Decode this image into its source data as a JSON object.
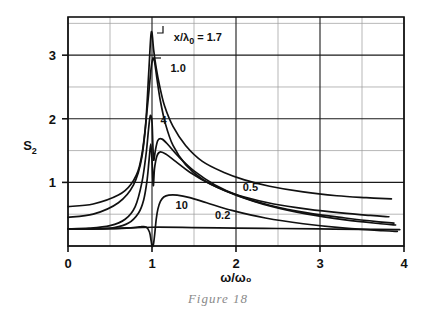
{
  "figure": {
    "caption": "Figure 18",
    "y_axis_label_main": "S",
    "y_axis_label_sub": "2",
    "x_axis_label_num": "ω",
    "x_axis_label_den": "ω",
    "x_axis_label_den_sub": "0",
    "x_axis_label_full": "ω/ω₀",
    "y_axis_label_full": "S₂",
    "param_label_prefix": "x/λ",
    "param_label_sub": "0",
    "param_label_eq": "= 1.7"
  },
  "chart_data": {
    "type": "line",
    "title": "Figure 18",
    "xlabel": "ω/ω₀",
    "ylabel": "S₂",
    "xlim": [
      0,
      4
    ],
    "ylim": [
      0,
      3.6
    ],
    "xticks": [
      0,
      1,
      2,
      3,
      4
    ],
    "xtick_labels": [
      "0",
      "1",
      "2",
      "3",
      "4"
    ],
    "yticks": [
      1,
      2,
      3
    ],
    "ytick_labels": [
      "1",
      "2",
      "3"
    ],
    "grid": true,
    "grid_spacing_x": 0.5,
    "grid_spacing_y": 0.5,
    "legend_position": "inline-curve-labels",
    "series_parameter_name": "x/λ₀",
    "series": [
      {
        "name": "1.7",
        "label": "x/λ₀ = 1.7",
        "label_x": 1.26,
        "label_y": 3.22,
        "peak_x": 1.0,
        "peak_y": 3.35,
        "x": [
          0.0,
          0.3,
          0.6,
          0.75,
          0.85,
          0.92,
          0.96,
          0.985,
          1.0,
          1.02,
          1.05,
          1.09,
          1.15,
          1.25,
          1.4,
          1.6,
          1.85,
          2.1,
          2.4,
          2.8,
          3.2,
          3.55,
          3.85
        ],
        "y": [
          0.62,
          0.66,
          0.8,
          0.97,
          1.25,
          1.85,
          2.7,
          3.28,
          3.35,
          3.08,
          2.8,
          2.52,
          2.2,
          1.88,
          1.58,
          1.33,
          1.16,
          1.04,
          0.94,
          0.85,
          0.79,
          0.76,
          0.74
        ]
      },
      {
        "name": "1.0",
        "label": "1.0",
        "label_x": 1.22,
        "label_y": 2.73,
        "peak_x": 1.02,
        "peak_y": 2.95,
        "x": [
          0.0,
          0.3,
          0.6,
          0.78,
          0.88,
          0.95,
          0.99,
          1.01,
          1.03,
          1.06,
          1.1,
          1.16,
          1.25,
          1.4,
          1.6,
          1.85,
          2.1,
          2.45,
          2.85,
          3.25,
          3.6,
          3.82
        ],
        "y": [
          0.45,
          0.5,
          0.68,
          0.96,
          1.4,
          2.25,
          2.8,
          2.94,
          2.9,
          2.62,
          2.28,
          1.92,
          1.58,
          1.28,
          1.05,
          0.88,
          0.77,
          0.66,
          0.58,
          0.52,
          0.48,
          0.46
        ]
      },
      {
        "name": "4",
        "label": "4",
        "label_x": 1.1,
        "label_y": 1.92,
        "peak_x": 1.08,
        "peak_y": 1.7,
        "x": [
          0.0,
          0.25,
          0.5,
          0.68,
          0.8,
          0.88,
          0.93,
          0.96,
          0.98,
          1.0,
          1.01,
          1.02,
          1.04,
          1.07,
          1.12,
          1.2,
          1.32,
          1.5,
          1.75,
          2.05,
          2.4,
          2.85,
          3.3,
          3.7,
          3.88
        ],
        "y": [
          0.27,
          0.28,
          0.32,
          0.42,
          0.62,
          1.0,
          1.45,
          1.85,
          2.05,
          1.95,
          1.6,
          1.35,
          1.5,
          1.66,
          1.68,
          1.58,
          1.4,
          1.18,
          0.96,
          0.78,
          0.64,
          0.52,
          0.44,
          0.38,
          0.36
        ]
      },
      {
        "name": "0.5",
        "label": "0.5",
        "label_x": 2.08,
        "label_y": 0.86,
        "peak_x": 1.1,
        "peak_y": 1.48,
        "x": [
          0.0,
          0.3,
          0.55,
          0.72,
          0.84,
          0.9,
          0.94,
          0.965,
          0.985,
          1.0,
          1.015,
          1.03,
          1.06,
          1.1,
          1.17,
          1.28,
          1.45,
          1.7,
          2.0,
          2.4,
          2.85,
          3.3,
          3.72,
          3.9
        ],
        "y": [
          0.27,
          0.27,
          0.29,
          0.36,
          0.52,
          0.72,
          1.02,
          1.35,
          1.6,
          1.35,
          0.95,
          1.22,
          1.42,
          1.48,
          1.44,
          1.33,
          1.16,
          0.97,
          0.8,
          0.63,
          0.5,
          0.41,
          0.35,
          0.33
        ]
      },
      {
        "name": "10",
        "label": "10",
        "label_x": 1.28,
        "label_y": 0.58,
        "peak_x": 1.28,
        "peak_y": 0.8,
        "x": [
          0.0,
          0.4,
          0.7,
          0.85,
          0.93,
          0.97,
          0.99,
          1.0,
          1.01,
          1.02,
          1.035,
          1.05,
          1.07,
          1.1,
          1.14,
          1.2,
          1.3,
          1.45,
          1.65,
          1.95,
          2.35,
          2.8,
          3.3,
          3.75,
          3.92
        ],
        "y": [
          0.27,
          0.27,
          0.28,
          0.3,
          0.3,
          0.22,
          0.08,
          0.0,
          0.0,
          0.05,
          0.22,
          0.42,
          0.58,
          0.7,
          0.77,
          0.8,
          0.8,
          0.76,
          0.68,
          0.56,
          0.44,
          0.35,
          0.28,
          0.24,
          0.23
        ]
      },
      {
        "name": "0.2",
        "label": "0.2",
        "label_x": 1.75,
        "label_y": 0.43,
        "peak_x": 1.0,
        "peak_y": 0.3,
        "x": [
          0.0,
          0.5,
          1.0,
          1.5,
          2.0,
          2.5,
          3.0,
          3.5,
          3.95
        ],
        "y": [
          0.265,
          0.275,
          0.295,
          0.29,
          0.282,
          0.275,
          0.268,
          0.262,
          0.258
        ]
      }
    ]
  }
}
